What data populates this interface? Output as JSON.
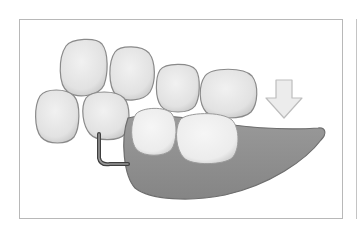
{
  "figure": {
    "elements": {
      "teeth_natural_count": 6,
      "teeth_prosthetic_count": 2,
      "clasp": "wire clasp",
      "base": "denture base (gum)",
      "arrow": "insertion direction arrow (down)"
    },
    "colors": {
      "background": "#ffffff",
      "frame": "#b8b8b8",
      "tooth_fill": "#e6e6e6",
      "tooth_shadow": "#8a8a8a",
      "prosthetic_tooth_fill": "#efefef",
      "base_fill": "#8f8f8f",
      "base_edge": "#6e6e6e",
      "clasp": "#4a4a4a",
      "arrow_fill": "#eaeaea",
      "arrow_edge": "#bdbdbd"
    }
  }
}
